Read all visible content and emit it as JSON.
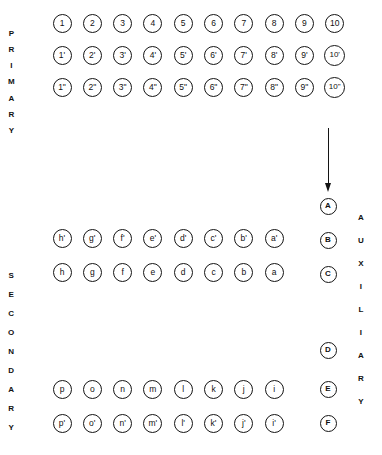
{
  "diagram": {
    "ink_color": "#141414",
    "background": "#ffffff"
  },
  "labels": {
    "primary": "PRIMARY",
    "secondary": "SECONDARY",
    "auxiliary": "AUXILIARY"
  },
  "primary_rows": [
    {
      "name": "primary-row-1",
      "nodes": [
        "1",
        "2",
        "3",
        "4",
        "5",
        "6",
        "7",
        "8",
        "9",
        "10"
      ]
    },
    {
      "name": "primary-row-2",
      "nodes": [
        "1'",
        "2'",
        "3'",
        "4'",
        "5'",
        "6'",
        "7'",
        "8'",
        "9'",
        "10'"
      ]
    },
    {
      "name": "primary-row-3",
      "nodes": [
        "1\"",
        "2\"",
        "3\"",
        "4\"",
        "5\"",
        "6\"",
        "7\"",
        "8\"",
        "9\"",
        "10\""
      ]
    }
  ],
  "secondary_rows": [
    {
      "name": "secondary-row-1",
      "nodes": [
        "h'",
        "g'",
        "f'",
        "e'",
        "d'",
        "c'",
        "b'",
        "a'"
      ]
    },
    {
      "name": "secondary-row-2",
      "nodes": [
        "h",
        "g",
        "f",
        "e",
        "d",
        "c",
        "b",
        "a"
      ]
    },
    {
      "name": "secondary-row-3",
      "nodes": [
        "p",
        "o",
        "n",
        "m",
        "l",
        "k",
        "j",
        "i"
      ]
    },
    {
      "name": "secondary-row-4",
      "nodes": [
        "p'",
        "o'",
        "n'",
        "m'",
        "l'",
        "k'",
        "j'",
        "i'"
      ]
    }
  ],
  "auxiliary_nodes": [
    "A",
    "B",
    "C",
    "D",
    "E",
    "F"
  ],
  "arrow": {
    "name": "downward-arrow",
    "direction": "down"
  }
}
